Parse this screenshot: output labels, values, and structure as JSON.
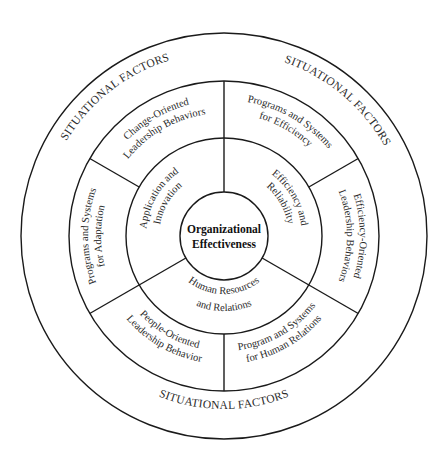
{
  "diagram": {
    "title": "Organizational Effectiveness",
    "center": {
      "lines": [
        "Organizational",
        "Effectiveness"
      ]
    },
    "geometry": {
      "cx": 224,
      "cy": 236,
      "radii": {
        "outer": 203,
        "ring2": 155,
        "ring3": 98,
        "inner": 44
      }
    },
    "colors": {
      "stroke": "#1a1a1a",
      "text": "#2a2a2a",
      "background": "#ffffff"
    },
    "effectiveness_criteria": [
      {
        "name": "Application and Innovation",
        "lines": [
          "Application and",
          "Innovation"
        ],
        "angle": 150
      },
      {
        "name": "Efficiency and Reliability",
        "lines": [
          "Efficiency and",
          "Reliability"
        ],
        "angle": 30
      },
      {
        "name": "Human Resources and Relations",
        "lines": [
          "Human Resources",
          "and Relations"
        ],
        "angle": 270
      }
    ],
    "determinants": [
      {
        "name": "Change-Oriented Leadership Behaviors",
        "lines": [
          "Change-Oriented",
          "Leadership Behaviors"
        ],
        "angle": 120
      },
      {
        "name": "Programs and Systems for Efficiency",
        "lines": [
          "Programs and Systems",
          "for Efficiency"
        ],
        "angle": 60
      },
      {
        "name": "Efficiency-Oriented Leadership Behaviors",
        "lines": [
          "Efficiency-Oriented",
          "Leadership Behaviors"
        ],
        "angle": 0
      },
      {
        "name": "Program and Systems for Human Relations",
        "lines": [
          "Program and Systems",
          "for Human Relations"
        ],
        "angle": 300
      },
      {
        "name": "People-Oriented Leadership Behavior",
        "lines": [
          "People-Oriented",
          "Leadership Behavior"
        ],
        "angle": 240
      },
      {
        "name": "Programs and Systems for Adaptation",
        "lines": [
          "Programs and Systems",
          "for Adaptation"
        ],
        "angle": 180
      }
    ],
    "situational_factors": [
      {
        "label": "SITUATIONAL FACTORS",
        "angle": 128
      },
      {
        "label": "SITUATIONAL FACTORS",
        "angle": 50
      },
      {
        "label": "SITUATIONAL FACTORS",
        "angle": 270
      }
    ],
    "dividers": {
      "through_both_rings": [
        90,
        210,
        330
      ],
      "outer_ring_only": [
        30,
        150,
        270
      ]
    }
  }
}
